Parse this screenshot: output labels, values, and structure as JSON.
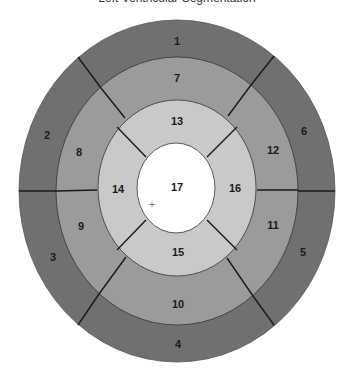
{
  "title": "Left Ventricular Segmentation",
  "colors": {
    "basal": "#707070",
    "mid": "#9b9b9b",
    "apical": "#c9c9c9",
    "apex": "#ffffff",
    "divider": "#1a1a1a"
  },
  "rings": {
    "basal": {
      "segments": [
        "1",
        "2",
        "3",
        "4",
        "5",
        "6"
      ]
    },
    "mid": {
      "segments": [
        "7",
        "8",
        "9",
        "10",
        "11",
        "12"
      ]
    },
    "apical": {
      "segments": [
        "13",
        "14",
        "15",
        "16"
      ]
    },
    "apex": {
      "segments": [
        "17"
      ]
    }
  },
  "labels": {
    "s1": "1",
    "s2": "2",
    "s3": "3",
    "s4": "4",
    "s5": "5",
    "s6": "6",
    "s7": "7",
    "s8": "8",
    "s9": "9",
    "s10": "10",
    "s11": "11",
    "s12": "12",
    "s13": "13",
    "s14": "14",
    "s15": "15",
    "s16": "16",
    "s17": "17"
  },
  "marker": "+"
}
